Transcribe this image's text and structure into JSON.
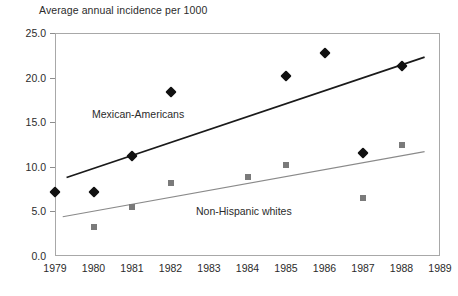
{
  "chart_data": {
    "type": "scatter",
    "title": "Average annual incidence per 1000",
    "xlabel": "",
    "ylabel": "",
    "xlim": [
      1979,
      1989
    ],
    "ylim": [
      0.0,
      25.0
    ],
    "grid": false,
    "legend_position": "inline-annotation",
    "x_ticks": [
      "1979",
      "1980",
      "1981",
      "1982",
      "1983",
      "1984",
      "1985",
      "1986",
      "1987",
      "1988",
      "1989"
    ],
    "y_ticks": [
      "0.0",
      "5.0",
      "10.0",
      "15.0",
      "20.0",
      "25.0"
    ],
    "y_tick_values": [
      0.0,
      5.0,
      10.0,
      15.0,
      20.0,
      25.0
    ],
    "series": [
      {
        "name": "Mexican-Americans",
        "marker": "diamond",
        "color": "#111111",
        "x": [
          1979,
          1980,
          1981,
          1982,
          1985,
          1986,
          1987,
          1988
        ],
        "values": [
          7.2,
          7.2,
          11.2,
          18.4,
          20.2,
          22.8,
          11.5,
          21.3
        ],
        "trendline": {
          "x0": 1979.3,
          "y0": 8.8,
          "x1": 1988.6,
          "y1": 22.3,
          "color": "#1a1a1a",
          "width": 1.7
        }
      },
      {
        "name": "Non-Hispanic whites",
        "marker": "square",
        "color": "#7a7a7a",
        "x": [
          1980,
          1981,
          1982,
          1984,
          1985,
          1987,
          1988
        ],
        "values": [
          3.3,
          5.5,
          8.2,
          8.9,
          10.2,
          6.5,
          12.4
        ],
        "trendline": {
          "x0": 1979.2,
          "y0": 4.4,
          "x1": 1988.6,
          "y1": 11.7,
          "color": "#8a8a8a",
          "width": 1.1
        }
      }
    ],
    "annotations": [
      {
        "text": "Mexican-Americans",
        "series": "Mexican-Americans"
      },
      {
        "text": "Non-Hispanic whites",
        "series": "Non-Hispanic whites"
      }
    ]
  }
}
